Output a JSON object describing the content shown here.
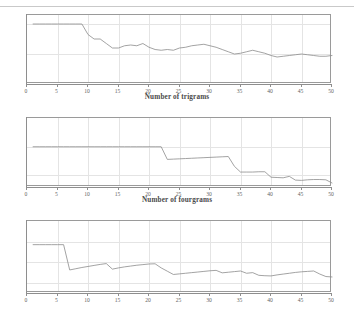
{
  "page": {
    "background_color": "#ffffff",
    "line_color": "#8b8b8b",
    "axis_color": "#8e8e8e",
    "grid_color": "#e4e4e4",
    "text_color": "#5f5f5f"
  },
  "axis_titles": {
    "trigrams": "Number of trigrams",
    "fourgrams": "Number of fourgrams"
  },
  "chart_data": [
    {
      "type": "line",
      "id": "chart-trigrams",
      "title": "",
      "xlabel": "Number of trigrams",
      "ylabel": "",
      "xlim": [
        0,
        50
      ],
      "ylim": [
        0.6,
        1.06
      ],
      "grid": true,
      "legend": "none",
      "xticks": [
        0,
        5,
        10,
        15,
        20,
        25,
        30,
        35,
        40,
        45,
        50
      ],
      "xtick_labels": [
        "0",
        "5",
        "10",
        "15",
        "20",
        "25",
        "30",
        "35",
        "40",
        "45",
        "50"
      ],
      "yticks": [
        0.6,
        0.8,
        1
      ],
      "ytick_labels": [
        "0.6",
        "0.8",
        "1"
      ],
      "series": [
        {
          "name": "accuracy",
          "x": [
            1,
            2,
            3,
            4,
            5,
            6,
            7,
            8,
            9,
            10,
            11,
            12,
            13,
            14,
            15,
            16,
            17,
            18,
            19,
            20,
            21,
            22,
            23,
            24,
            25,
            26,
            27,
            28,
            29,
            30,
            31,
            32,
            33,
            34,
            35,
            36,
            37,
            38,
            39,
            40,
            41,
            42,
            43,
            44,
            45,
            46,
            47,
            48,
            49,
            50
          ],
          "values": [
            1,
            1,
            1,
            1,
            1,
            1,
            1,
            1,
            1,
            0.93,
            0.9,
            0.9,
            0.87,
            0.84,
            0.84,
            0.855,
            0.86,
            0.855,
            0.87,
            0.845,
            0.83,
            0.825,
            0.83,
            0.825,
            0.84,
            0.845,
            0.855,
            0.86,
            0.865,
            0.855,
            0.845,
            0.83,
            0.815,
            0.8,
            0.805,
            0.815,
            0.825,
            0.815,
            0.805,
            0.79,
            0.78,
            0.785,
            0.79,
            0.795,
            0.8,
            0.795,
            0.79,
            0.785,
            0.785,
            0.79
          ]
        }
      ]
    },
    {
      "type": "line",
      "id": "chart-middle",
      "title": "",
      "xlabel": "Number of fourgrams",
      "ylabel": "",
      "xlim": [
        0,
        50
      ],
      "ylim": [
        0.86,
        1.1
      ],
      "grid": true,
      "legend": "none",
      "xticks": [
        0,
        5,
        10,
        15,
        20,
        25,
        30,
        35,
        40,
        45,
        50
      ],
      "xtick_labels": [
        "0",
        "5",
        "10",
        "15",
        "20",
        "25",
        "30",
        "35",
        "40",
        "45",
        "50"
      ],
      "yticks": [
        0.9,
        1,
        1.1
      ],
      "ytick_labels": [
        "0.9",
        "1",
        "1.1"
      ],
      "series": [
        {
          "name": "accuracy",
          "x": [
            1,
            2,
            3,
            4,
            5,
            6,
            7,
            8,
            9,
            10,
            11,
            12,
            13,
            14,
            15,
            16,
            17,
            18,
            19,
            20,
            21,
            22,
            23,
            24,
            25,
            26,
            27,
            28,
            29,
            30,
            31,
            32,
            33,
            34,
            35,
            36,
            37,
            38,
            39,
            40,
            41,
            42,
            43,
            44,
            45,
            46,
            47,
            48,
            49,
            50
          ],
          "values": [
            1,
            1,
            1,
            1,
            1,
            1,
            1,
            1,
            1,
            1,
            1,
            1,
            1,
            1,
            1,
            1,
            1,
            1,
            1,
            1,
            1,
            1,
            0.956,
            0.957,
            0.958,
            0.959,
            0.96,
            0.961,
            0.962,
            0.963,
            0.964,
            0.965,
            0.966,
            0.932,
            0.912,
            0.912,
            0.912,
            0.913,
            0.913,
            0.894,
            0.893,
            0.892,
            0.897,
            0.884,
            0.883,
            0.885,
            0.886,
            0.886,
            0.885,
            0.874
          ]
        }
      ]
    },
    {
      "type": "line",
      "id": "chart-fourgrams",
      "title": "",
      "xlabel": "",
      "ylabel": "",
      "xlim": [
        0,
        50
      ],
      "ylim": [
        0.75,
        1.1
      ],
      "grid": true,
      "legend": "none",
      "xticks": [
        0,
        5,
        10,
        15,
        20,
        25,
        30,
        35,
        40,
        45,
        50
      ],
      "xtick_labels": [
        "0",
        "5",
        "10",
        "15",
        "20",
        "25",
        "30",
        "35",
        "40",
        "45",
        "50"
      ],
      "yticks": [
        0.8,
        0.9,
        1,
        1.1
      ],
      "ytick_labels": [
        "0.8",
        "0.9",
        "1",
        "1.1"
      ],
      "series": [
        {
          "name": "accuracy",
          "x": [
            1,
            2,
            3,
            4,
            5,
            6,
            7,
            8,
            9,
            10,
            11,
            12,
            13,
            14,
            15,
            16,
            17,
            18,
            19,
            20,
            21,
            22,
            23,
            24,
            25,
            26,
            27,
            28,
            29,
            30,
            31,
            32,
            33,
            34,
            35,
            36,
            37,
            38,
            39,
            40,
            41,
            42,
            43,
            44,
            45,
            46,
            47,
            48,
            49,
            50
          ],
          "values": [
            0.985,
            0.985,
            0.985,
            0.985,
            0.985,
            0.985,
            0.862,
            0.868,
            0.874,
            0.879,
            0.884,
            0.889,
            0.893,
            0.866,
            0.872,
            0.877,
            0.881,
            0.885,
            0.888,
            0.891,
            0.892,
            0.872,
            0.856,
            0.84,
            0.843,
            0.846,
            0.849,
            0.852,
            0.855,
            0.858,
            0.86,
            0.848,
            0.851,
            0.854,
            0.857,
            0.846,
            0.849,
            0.836,
            0.834,
            0.833,
            0.838,
            0.842,
            0.846,
            0.85,
            0.853,
            0.855,
            0.857,
            0.842,
            0.83,
            0.828
          ]
        }
      ]
    }
  ]
}
